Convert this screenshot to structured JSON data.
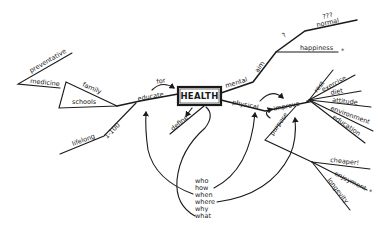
{
  "diagram": {
    "type": "mind-map",
    "center": "HEALTH",
    "branches": {
      "educate": {
        "label": "educate",
        "link": "for",
        "children": {
          "schools": "schools",
          "family": "family",
          "medicine": "medicine",
          "preventative": "preventative",
          "range": "1-100",
          "lifelong": "lifelong"
        }
      },
      "mental": {
        "label": "mental",
        "aim": "aim",
        "question": "?",
        "normal": "normal",
        "normal_q": "???",
        "happiness": "happiness",
        "star": "*"
      },
      "define": {
        "label": "define"
      },
      "physical": {
        "label": "physical",
        "improve": "improve",
        "purpose": "purpose",
        "factors": [
          "rest",
          "exercise",
          "diet",
          "attitude",
          "environment",
          "education"
        ],
        "outcomes": [
          "cheaper!",
          "enjoyment",
          "longevity"
        ],
        "star": "*"
      }
    },
    "questions": [
      "who",
      "how",
      "when",
      "where",
      "why",
      "what"
    ]
  }
}
